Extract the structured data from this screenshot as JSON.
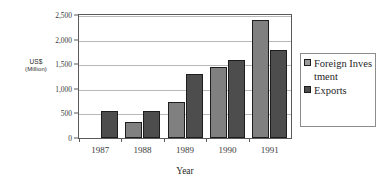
{
  "chart_data": {
    "type": "bar",
    "title": "",
    "subtitle": "",
    "xlabel": "Year",
    "ylabel": "US$ (Million)",
    "ylabel_line1": "US$",
    "ylabel_line2": "(Million)",
    "categories": [
      "1987",
      "1988",
      "1989",
      "1990",
      "1991"
    ],
    "series": [
      {
        "name": "Foreign Investment",
        "color": "#808080",
        "values": [
          0,
          330,
          740,
          1440,
          2390
        ]
      },
      {
        "name": "Exports",
        "color": "#4d4d4d",
        "values": [
          550,
          550,
          1300,
          1590,
          1790
        ]
      }
    ],
    "ylim": [
      0,
      2500
    ],
    "ytick_values": [
      0,
      500,
      1000,
      1500,
      2000,
      2500
    ],
    "ytick_labels": [
      "0",
      "500",
      "1,000",
      "1,500",
      "2,000",
      "2,500"
    ],
    "grid": true,
    "grid_axis": "y",
    "legend_position": "right",
    "legend_entries": [
      {
        "label": "Foreign Investment",
        "color": "#808080"
      },
      {
        "label": "Exports",
        "color": "#4d4d4d"
      }
    ]
  },
  "colors": {
    "series_foreign_investment": "#808080",
    "series_exports": "#4d4d4d",
    "axis_line": "#5a5a5a",
    "gridline": "#b9b9b9",
    "bar_outline": "#1d1d1d",
    "legend_border": "#8c8c8c",
    "background": "#ffffff",
    "text": "#2b2b2b"
  }
}
